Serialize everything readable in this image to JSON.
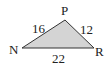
{
  "diagram": {
    "type": "triangle",
    "fill_color": "#d4d4d4",
    "stroke_color": "#333333",
    "vertices": [
      {
        "label": "N",
        "x": 22,
        "y": 48
      },
      {
        "label": "P",
        "x": 65,
        "y": 20
      },
      {
        "label": "R",
        "x": 94,
        "y": 48
      }
    ],
    "sides": {
      "NP": "16",
      "PR": "12",
      "NR": "22"
    }
  }
}
